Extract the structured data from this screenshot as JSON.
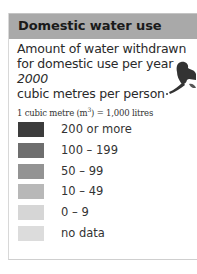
{
  "header": {
    "title": "Domestic water use"
  },
  "description": {
    "line1": "Amount of water withdrawn",
    "line2": "for domestic use per year",
    "year": "2000",
    "unit": "cubic metres per person"
  },
  "note": {
    "prefix": "1 cubic metre (m",
    "sup": "3",
    "suffix": ") = 1,000 litres"
  },
  "legend": {
    "items": [
      {
        "label": "200 or more",
        "color": "#3c3c3c"
      },
      {
        "label": "100 – 199",
        "color": "#6e6e6e"
      },
      {
        "label": "50 – 99",
        "color": "#939393"
      },
      {
        "label": "10 – 49",
        "color": "#b8b8b8"
      },
      {
        "label": "0 – 9",
        "color": "#d6d6d6"
      },
      {
        "label": "no data",
        "color": "#dcdcdc"
      }
    ]
  },
  "map": {
    "fragment_icon": "landmass-fragment-icon",
    "fragment_color": "#333333"
  }
}
